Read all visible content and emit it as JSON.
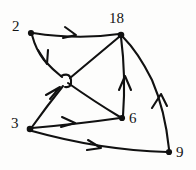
{
  "figure": {
    "name": "directed-graph",
    "background_color": "#fdfdfc",
    "ink_color": "#111111",
    "width": 196,
    "height": 170
  },
  "graph": {
    "type": "directed-graph",
    "node_labels": [
      "2",
      "18",
      "3",
      "6",
      "9"
    ],
    "nodes": [
      {
        "id": "n2",
        "label": "2",
        "x": 31,
        "y": 33,
        "label_x": 13,
        "label_y": 20,
        "label_anchor": "left"
      },
      {
        "id": "n18",
        "label": "18",
        "x": 121,
        "y": 35,
        "label_x": 110,
        "label_y": 12,
        "label_anchor": "above"
      },
      {
        "id": "n3",
        "label": "3",
        "x": 30,
        "y": 129,
        "label_x": 12,
        "label_y": 117,
        "label_anchor": "left"
      },
      {
        "id": "n6",
        "label": "6",
        "x": 122,
        "y": 118,
        "label_x": 129,
        "label_y": 112,
        "label_anchor": "right"
      },
      {
        "id": "n9",
        "label": "9",
        "x": 169,
        "y": 152,
        "label_x": 176,
        "label_y": 146,
        "label_anchor": "right"
      }
    ],
    "crossing_point": {
      "x": 66,
      "y": 80,
      "style": "hop-bridge"
    },
    "edges": [
      {
        "id": "e-2-18",
        "from": "2",
        "to": "18",
        "label": "2 to 18",
        "arrow_at": {
          "x": 74,
          "y": 32
        }
      },
      {
        "id": "e-2-mid",
        "from": "2",
        "to": "crossing",
        "label": "2 to junction",
        "arrow_at": {
          "x": 46,
          "y": 62
        }
      },
      {
        "id": "e-3-mid",
        "from": "3",
        "to": "crossing",
        "label": "3 to junction",
        "arrow_at": {
          "x": 58,
          "y": 89
        }
      },
      {
        "id": "e-mid-18",
        "from": "crossing",
        "to": "18",
        "label": "junction to 18",
        "arrow_at": null
      },
      {
        "id": "e-mid-6",
        "from": "crossing",
        "to": "6",
        "label": "junction to 6",
        "arrow_at": null
      },
      {
        "id": "e-3-6",
        "from": "3",
        "to": "6",
        "label": "3 to 6",
        "arrow_at": {
          "x": 73,
          "y": 122
        }
      },
      {
        "id": "e-3-9",
        "from": "3",
        "to": "9",
        "label": "3 to 9",
        "arrow_at": {
          "x": 99,
          "y": 147
        }
      },
      {
        "id": "e-6-18",
        "from": "6",
        "to": "18",
        "label": "6 to 18",
        "arrow_at": {
          "x": 125,
          "y": 78
        }
      },
      {
        "id": "e-9-18",
        "from": "9",
        "to": "18",
        "label": "9 to 18",
        "arrow_at": {
          "x": 160,
          "y": 96
        }
      }
    ]
  }
}
